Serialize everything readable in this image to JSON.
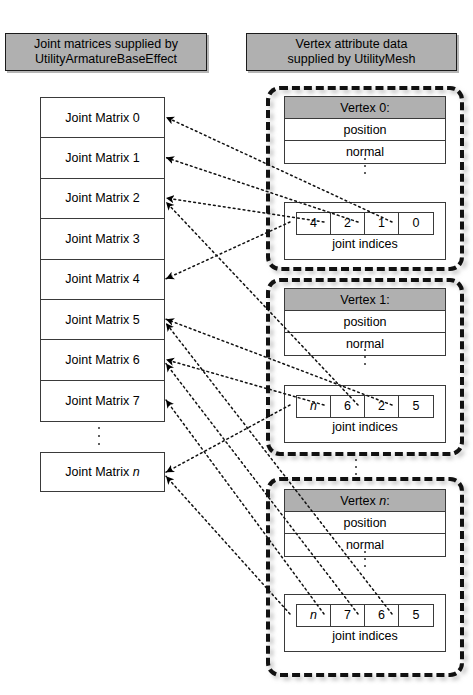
{
  "diagram": {
    "colors": {
      "header_fill": "#b0b0b0",
      "box_border": "#3a3a3a",
      "dashed_border": "#111111",
      "page_bg": "#ffffff"
    }
  },
  "headers": {
    "left": "Joint matrices supplied by UtilityArmatureBaseEffect",
    "left_line1": "Joint matrices supplied by",
    "left_line2": "UtilityArmatureBaseEffect",
    "right": "Vertex attribute data supplied by UtilityMesh",
    "right_line1": "Vertex attribute data",
    "right_line2": "supplied by UtilityMesh"
  },
  "joint_matrices": {
    "stack": [
      {
        "label": "Joint Matrix 0",
        "index": "0"
      },
      {
        "label": "Joint Matrix 1",
        "index": "1"
      },
      {
        "label": "Joint Matrix 2",
        "index": "2"
      },
      {
        "label": "Joint Matrix 3",
        "index": "3"
      },
      {
        "label": "Joint Matrix 4",
        "index": "4"
      },
      {
        "label": "Joint Matrix 5",
        "index": "5"
      },
      {
        "label": "Joint Matrix 6",
        "index": "6"
      },
      {
        "label": "Joint Matrix 7",
        "index": "7"
      }
    ],
    "ellipsis": "⋮",
    "last": {
      "prefix": "Joint Matrix ",
      "index": "n"
    }
  },
  "vertices": [
    {
      "id": "vertex-0",
      "title": "Vertex 0:",
      "attributes": [
        "position",
        "normal"
      ],
      "ellipsis": "⋮",
      "joint_indices": [
        "4",
        "2",
        "1",
        "0"
      ],
      "joint_indices_label": "joint indices"
    },
    {
      "id": "vertex-1",
      "title": "Vertex 1:",
      "attributes": [
        "position",
        "normal"
      ],
      "ellipsis": "⋮",
      "joint_indices": [
        "n",
        "6",
        "2",
        "5"
      ],
      "joint_indices_label": "joint indices"
    },
    {
      "id": "vertex-n",
      "title": "Vertex n:",
      "attributes": [
        "position",
        "normal"
      ],
      "ellipsis": "⋮",
      "joint_indices": [
        "n",
        "7",
        "6",
        "5"
      ],
      "joint_indices_label": "joint indices"
    }
  ],
  "vertex_gap_ellipsis": "⋮",
  "links": [
    {
      "from": "vertex-0.joint_indices.0",
      "to": "Joint Matrix 4"
    },
    {
      "from": "vertex-0.joint_indices.1",
      "to": "Joint Matrix 2"
    },
    {
      "from": "vertex-0.joint_indices.2",
      "to": "Joint Matrix 1"
    },
    {
      "from": "vertex-0.joint_indices.3",
      "to": "Joint Matrix 0"
    },
    {
      "from": "vertex-1.joint_indices.0",
      "to": "Joint Matrix n"
    },
    {
      "from": "vertex-1.joint_indices.1",
      "to": "Joint Matrix 6"
    },
    {
      "from": "vertex-1.joint_indices.2",
      "to": "Joint Matrix 2"
    },
    {
      "from": "vertex-1.joint_indices.3",
      "to": "Joint Matrix 5"
    },
    {
      "from": "vertex-n.joint_indices.0",
      "to": "Joint Matrix n"
    },
    {
      "from": "vertex-n.joint_indices.1",
      "to": "Joint Matrix 7"
    },
    {
      "from": "vertex-n.joint_indices.2",
      "to": "Joint Matrix 6"
    },
    {
      "from": "vertex-n.joint_indices.3",
      "to": "Joint Matrix 5"
    }
  ]
}
